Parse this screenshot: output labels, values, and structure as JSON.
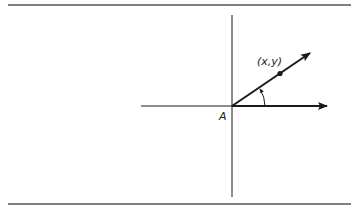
{
  "diagram": {
    "type": "coordinate-ray-diagram",
    "colors": {
      "ink": "#1a1a1a",
      "rule": "#555555",
      "background": "#ffffff"
    },
    "labels": {
      "origin": "A",
      "point": "(x,y)"
    },
    "elements": {
      "top_rule": "horizontal rule",
      "bottom_rule": "horizontal rule",
      "vertical_axis": "vertical axis line",
      "horizontal_axis": "horizontal axis line",
      "reference_arrow": "arrow along positive horizontal axis",
      "ray_arrow": "ray from A through (x,y)",
      "point_marker": "dot at (x,y)",
      "angle_arc": "arc with arrow measuring angle from horizontal to ray"
    }
  }
}
